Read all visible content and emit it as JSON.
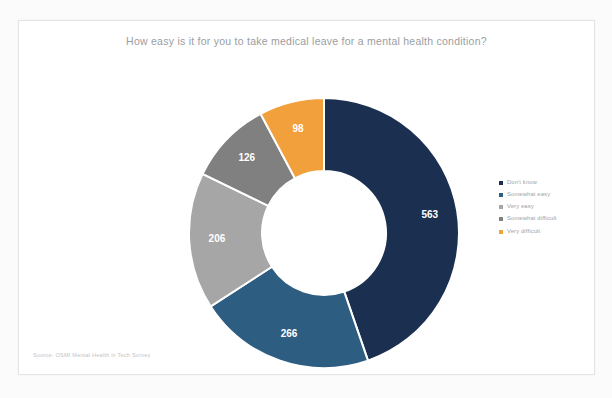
{
  "card": {
    "title": "How easy is it for you to take medical leave for a mental health condition?",
    "source_note": "Source: OSMI Mental Health in Tech Survey"
  },
  "legend": {
    "position": "right",
    "items": [
      {
        "label": "Don't know",
        "color": "#1b3050"
      },
      {
        "label": "Somewhat easy",
        "color": "#2e5d82"
      },
      {
        "label": "Very easy",
        "color": "#a6a6a6"
      },
      {
        "label": "Somewhat difficult",
        "color": "#808080"
      },
      {
        "label": "Very difficult",
        "color": "#f2a03c"
      }
    ]
  },
  "chart_data": {
    "type": "pie",
    "variant": "donut",
    "title": "How easy is it for you to take medical leave for a mental health condition?",
    "xlabel": "",
    "ylabel": "",
    "total": 1259,
    "categories": [
      "Don't know",
      "Somewhat easy",
      "Very easy",
      "Somewhat difficult",
      "Very difficult"
    ],
    "values": [
      563,
      266,
      206,
      126,
      98
    ],
    "colors": [
      "#1b3050",
      "#2e5d82",
      "#a6a6a6",
      "#808080",
      "#f2a03c"
    ],
    "data_labels": [
      "563",
      "266",
      "206",
      "126",
      "98"
    ],
    "data_label_color": "#ffffff",
    "start_angle_deg": 0,
    "direction": "clockwise",
    "center_x": 305,
    "center_y": 212,
    "outer_radius": 135,
    "inner_radius": 62,
    "grid": false,
    "legend_position": "right"
  }
}
